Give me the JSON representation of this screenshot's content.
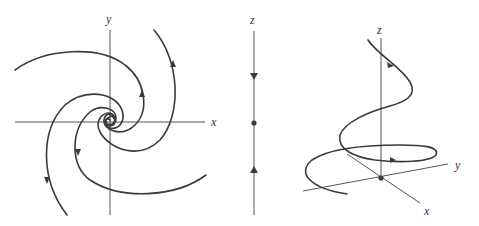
{
  "panels": [
    {
      "id": "phase-portrait-xy",
      "description": "Stable spiral (focus) in the xy-plane; trajectories spiral inward to origin",
      "axis_labels": {
        "x": "x",
        "y": "y"
      }
    },
    {
      "id": "z-axis-line",
      "description": "One-dimensional flow on z-axis; arrows point toward fixed point at origin",
      "axis_labels": {
        "z": "z"
      }
    },
    {
      "id": "helix-3d",
      "description": "3D trajectory spiraling down toward origin around z-axis",
      "axis_labels": {
        "x": "x",
        "y": "y",
        "z": "z"
      }
    }
  ]
}
